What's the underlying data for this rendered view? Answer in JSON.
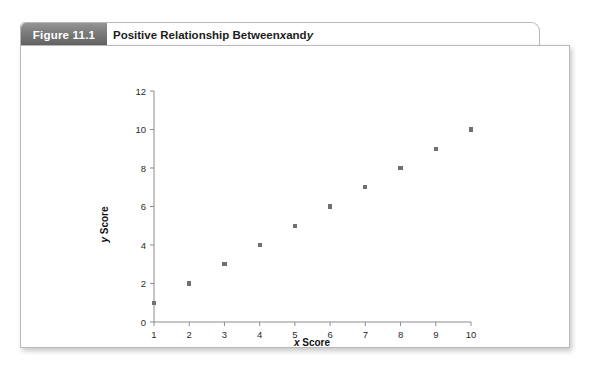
{
  "figure": {
    "tab_label": "Figure 11.1",
    "title_parts": {
      "before": "Positive Relationship Between ",
      "italic_x": "x",
      "middle": " and ",
      "italic_y": "y"
    },
    "title_plain": "Positive Relationship Between x and y"
  },
  "chart_data": {
    "type": "scatter",
    "title": "Positive Relationship Between x and y",
    "xlabel": "x Score",
    "ylabel": "y Score",
    "xlabel_italic_part": "x",
    "xlabel_rest": " Score",
    "ylabel_italic_part": "y",
    "ylabel_rest": " Score",
    "x": [
      1,
      2,
      3,
      4,
      5,
      6,
      7,
      8,
      9,
      10
    ],
    "y": [
      1,
      2,
      3,
      4,
      5,
      6,
      7,
      8,
      9,
      10
    ],
    "points": [
      {
        "x": 1,
        "y": 1
      },
      {
        "x": 2,
        "y": 2
      },
      {
        "x": 3,
        "y": 3
      },
      {
        "x": 4,
        "y": 4
      },
      {
        "x": 5,
        "y": 5
      },
      {
        "x": 6,
        "y": 6
      },
      {
        "x": 7,
        "y": 7
      },
      {
        "x": 8,
        "y": 8
      },
      {
        "x": 9,
        "y": 9
      },
      {
        "x": 10,
        "y": 10
      }
    ],
    "xlim": [
      1,
      10
    ],
    "ylim": [
      0,
      12
    ],
    "xticks": [
      1,
      2,
      3,
      4,
      5,
      6,
      7,
      8,
      9,
      10
    ],
    "xtick_labels": [
      "1",
      "2",
      "3",
      "4",
      "5",
      "6",
      "7",
      "8",
      "9",
      "10"
    ],
    "yticks": [
      0,
      2,
      4,
      6,
      8,
      10,
      12
    ],
    "ytick_labels": [
      "0",
      "2",
      "4",
      "6",
      "8",
      "10",
      "12"
    ],
    "grid": false,
    "legend": false,
    "marker": "square",
    "marker_color": "#707070",
    "axis_color": "#8c8c8c"
  },
  "colors": {
    "tab_text": "#ffffff",
    "tab_gradient_top": "#949494",
    "tab_gradient_bottom": "#606060",
    "panel_border": "#b9b9b9",
    "panel_background": "#ffffff",
    "title_text": "#1d1d1d",
    "marker": "#707070",
    "axis": "#8c8c8c"
  }
}
